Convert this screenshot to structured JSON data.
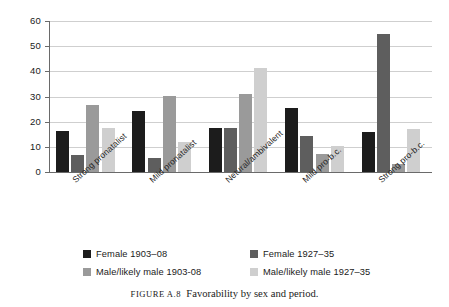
{
  "caption": {
    "figure_number": "FIGURE A.8",
    "text": "Favorability by sex and period."
  },
  "chart_data": {
    "type": "bar",
    "title": "Favorability by sex and period.",
    "xlabel": "",
    "ylabel": "",
    "ylim": [
      0,
      60
    ],
    "yticks": [
      0,
      10,
      20,
      30,
      40,
      50,
      60
    ],
    "ytick_labels": [
      "0",
      "10",
      "20",
      "30",
      "40",
      "50",
      "60"
    ],
    "grid": true,
    "legend_position": "bottom",
    "categories": [
      "Strong pronatalist",
      "Mild pronatalist",
      "Netural/ambivalent",
      "Mild pro-b.c.",
      "Strong pro-b.c."
    ],
    "series": [
      {
        "name": "Female 1903–08",
        "color": "#1c1c1c",
        "values": [
          16.1,
          24.4,
          17.5,
          25.4,
          15.8
        ]
      },
      {
        "name": "Female 1927–35",
        "color": "#5e5e5e",
        "values": [
          6.8,
          5.6,
          17.3,
          14.3,
          54.7
        ]
      },
      {
        "name": "Male/likely male 1903-08",
        "color": "#9a9a9a",
        "values": [
          26.7,
          30.1,
          30.9,
          7.3,
          3.3
        ]
      },
      {
        "name": "Male/likely male 1927–35",
        "color": "#cfcfcf",
        "values": [
          17.6,
          11.9,
          41.3,
          10.2,
          17.0
        ]
      }
    ]
  },
  "legend": {
    "entries": [
      {
        "label": "Female 1903–08",
        "color": "#1c1c1c"
      },
      {
        "label": "Female 1927–35",
        "color": "#5e5e5e"
      },
      {
        "label": "Male/likely male 1903-08",
        "color": "#9a9a9a"
      },
      {
        "label": "Male/likely male 1927–35",
        "color": "#cfcfcf"
      }
    ]
  }
}
